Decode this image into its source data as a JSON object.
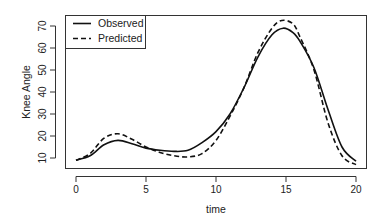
{
  "chart_data": {
    "type": "line",
    "title": "",
    "xlabel": "time",
    "ylabel": "Knee Angle",
    "xlim": [
      0,
      20
    ],
    "ylim": [
      7,
      76
    ],
    "xticks": [
      0,
      5,
      10,
      15,
      20
    ],
    "yticks": [
      10,
      20,
      30,
      40,
      50,
      60,
      70
    ],
    "grid": false,
    "legend": {
      "position": "top-left",
      "entries": [
        "Observed",
        "Predicted"
      ]
    },
    "series": [
      {
        "name": "Observed",
        "style": "solid",
        "x": [
          0,
          1,
          2,
          3,
          4,
          5,
          6,
          7,
          8,
          9,
          10,
          11,
          12,
          13,
          14,
          14.8,
          15.5,
          16,
          17,
          18,
          19,
          20
        ],
        "y": [
          9,
          11,
          16,
          18,
          16.5,
          14.5,
          13.5,
          13,
          13.5,
          17,
          22,
          30,
          42,
          56,
          66,
          69,
          67,
          63,
          51,
          32,
          15,
          8.5
        ]
      },
      {
        "name": "Predicted",
        "style": "dashed",
        "x": [
          0,
          1,
          2,
          3,
          4,
          5,
          6,
          7,
          8,
          9,
          10,
          11,
          12,
          13,
          14,
          14.7,
          15.5,
          16,
          17,
          18,
          19,
          20
        ],
        "y": [
          9,
          12,
          19,
          21,
          18.5,
          15,
          12.5,
          11,
          10.5,
          12,
          18,
          29,
          42,
          58,
          69,
          72.5,
          71,
          65,
          50,
          26,
          11,
          7
        ]
      }
    ]
  },
  "labels": {
    "xlabel": "time",
    "ylabel": "Knee Angle",
    "legend_observed": "Observed",
    "legend_predicted": "Predicted"
  }
}
